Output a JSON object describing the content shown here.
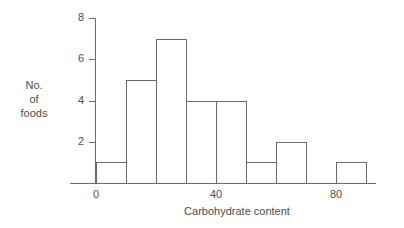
{
  "chart_data": {
    "type": "bar",
    "subtype": "histogram",
    "title": "",
    "xlabel": "Carbohydrate content",
    "ylabel_lines": [
      "No.",
      "of",
      "foods"
    ],
    "ylabel": "No. of foods",
    "xlim": [
      0,
      94
    ],
    "ylim": [
      0,
      8
    ],
    "grid": false,
    "legend": null,
    "bin_width": 10,
    "bin_edges": [
      0,
      10,
      20,
      30,
      40,
      50,
      60,
      70,
      80,
      90
    ],
    "categories": [
      "0-10",
      "10-20",
      "20-30",
      "30-40",
      "40-50",
      "50-60",
      "60-70",
      "70-80",
      "80-90"
    ],
    "values": [
      1,
      5,
      7,
      4,
      4,
      1,
      2,
      0,
      1
    ],
    "bars": [
      {
        "start": 0,
        "end": 10,
        "value": 1
      },
      {
        "start": 10,
        "end": 20,
        "value": 5
      },
      {
        "start": 20,
        "end": 30,
        "value": 7
      },
      {
        "start": 30,
        "end": 40,
        "value": 4
      },
      {
        "start": 40,
        "end": 50,
        "value": 4
      },
      {
        "start": 50,
        "end": 60,
        "value": 1
      },
      {
        "start": 60,
        "end": 70,
        "value": 2
      },
      {
        "start": 70,
        "end": 80,
        "value": 0
      },
      {
        "start": 80,
        "end": 90,
        "value": 1
      }
    ],
    "yticks": [
      2,
      4,
      6,
      8
    ],
    "ytick_labels": [
      "2",
      "4",
      "6",
      "8"
    ],
    "xticks": [
      0,
      40,
      80
    ],
    "xtick_labels": [
      "0",
      "40",
      "80"
    ],
    "colors": {
      "background": "#ffffff",
      "axis": "#6b6b6b",
      "bar_stroke": "#6b6b6b",
      "bar_fill": "transparent",
      "text": "#4d4d4d"
    }
  }
}
